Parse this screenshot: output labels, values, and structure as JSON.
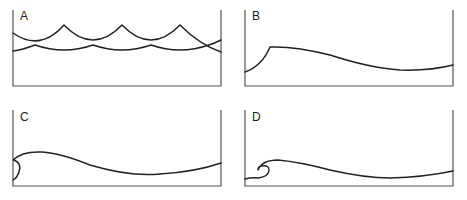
{
  "figure": {
    "panels": [
      {
        "label": "A",
        "stage": "trochoidal waves - overlapping crests"
      },
      {
        "label": "B",
        "stage": "wave steepens with sharp crest"
      },
      {
        "label": "C",
        "stage": "crest begins to curl over"
      },
      {
        "label": "D",
        "stage": "wave breaks - plunging curl"
      }
    ]
  },
  "colors": {
    "line": "#222222",
    "frame": "#555555",
    "background": "#ffffff"
  }
}
